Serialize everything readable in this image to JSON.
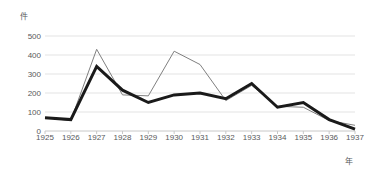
{
  "chart_data": {
    "type": "line",
    "title": "",
    "xlabel": "年",
    "ylabel": "件",
    "categories": [
      "1925",
      "1926",
      "1927",
      "1928",
      "1929",
      "1930",
      "1931",
      "1932",
      "1933",
      "1934",
      "1935",
      "1936",
      "1937"
    ],
    "ylim": [
      0,
      500
    ],
    "yticks": [
      0,
      100,
      200,
      300,
      400,
      500
    ],
    "ytick_labels": [
      "0",
      "100",
      "200",
      "300",
      "400",
      "500"
    ],
    "grid": "horizontal",
    "legend": "none",
    "series": [
      {
        "name": "gray-thin-series",
        "color": "#808080",
        "line_width": 1,
        "values": [
          70,
          55,
          430,
          190,
          185,
          420,
          350,
          160,
          240,
          130,
          125,
          55,
          30
        ]
      },
      {
        "name": "black-thick-series",
        "color": "#1a1a1a",
        "line_width": 3,
        "values": [
          70,
          60,
          340,
          215,
          150,
          190,
          200,
          170,
          250,
          125,
          150,
          60,
          10
        ]
      }
    ],
    "axis_color": "#c8c8c8",
    "grid_color": "#e3e3e3",
    "text_color": "#58595b",
    "background": "#ffffff"
  }
}
